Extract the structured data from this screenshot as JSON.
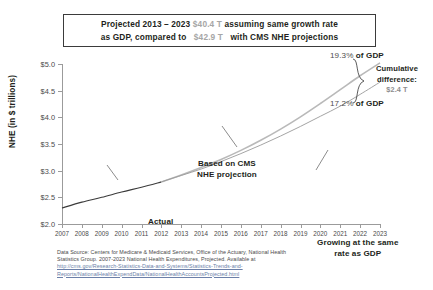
{
  "title": {
    "line1_prefix": "Projected 2013 – 2023",
    "line1_amount": "$40.4 T",
    "line1_suffix": "assuming same growth rate",
    "line2_prefix": "as GDP, compared to",
    "line2_amount": "$42.9 T",
    "line2_suffix": "with CMS NHE projections"
  },
  "annotations": {
    "actual": "Actual",
    "cms_line1": "Based on CMS",
    "cms_line2": "NHE projection",
    "gdp_line1": "Growing at the same",
    "gdp_line2": "rate as GDP"
  },
  "callouts": {
    "top_pct": "19.3%",
    "top_pct_suffix": " of GDP",
    "bottom_pct": "17.2%",
    "bottom_pct_suffix": " of GDP",
    "cumulative_label1": "Cumulative",
    "cumulative_label2": "difference:",
    "cumulative_value": "$2.4 T"
  },
  "source": {
    "line1": "Data Source: Centers for Medicare & Medicaid Services, Office of the Actuary, National Health",
    "line2": "Statistics Group. 2007-2023 National Health Expenditures, Projected. Available at",
    "url1": "http://cms.gov/Research-Statistics-Data-and-Systems/Statistics-Trends-and-",
    "url2": "Reports/NationalHealthExpendData/NationalHealthAccountsProjected.html"
  },
  "colors": {
    "actual_line": "#3b3b3b",
    "cms_line": "#b9b9b9",
    "gdp_line": "#9a9a9a",
    "axis": "#9b9b9b",
    "amount_gray": "#a6a6a6",
    "url_blue": "#6b7fa8"
  },
  "chart_data": {
    "type": "line",
    "xlabel": "",
    "ylabel": "NHE (in $ trillions)",
    "xlim": [
      2007,
      2023
    ],
    "ylim": [
      2.0,
      5.0
    ],
    "ytick_labels": [
      "$2.0",
      "$2.5",
      "$3.0",
      "$3.5",
      "$4.0",
      "$4.5",
      "$5.0"
    ],
    "ytick_values": [
      2.0,
      2.5,
      3.0,
      3.5,
      4.0,
      4.5,
      5.0
    ],
    "x": [
      2007,
      2008,
      2009,
      2010,
      2011,
      2012,
      2013,
      2014,
      2015,
      2016,
      2017,
      2018,
      2019,
      2020,
      2021,
      2022,
      2023
    ],
    "grid": false,
    "legend": "none",
    "series": [
      {
        "name": "Actual",
        "style": "solid",
        "color": "#3b3b3b",
        "values": [
          2.3,
          2.41,
          2.5,
          2.6,
          2.69,
          2.79,
          null,
          null,
          null,
          null,
          null,
          null,
          null,
          null,
          null,
          null,
          null
        ]
      },
      {
        "name": "Based on CMS NHE projection",
        "style": "solid-light",
        "color": "#b9b9b9",
        "values": [
          null,
          null,
          null,
          null,
          null,
          2.79,
          2.92,
          3.06,
          3.21,
          3.38,
          3.57,
          3.78,
          4.01,
          4.26,
          4.52,
          4.78,
          5.02
        ]
      },
      {
        "name": "Growing at the same rate as GDP",
        "style": "solid-gray",
        "color": "#9a9a9a",
        "values": [
          null,
          null,
          null,
          null,
          null,
          2.79,
          2.91,
          3.03,
          3.17,
          3.32,
          3.48,
          3.65,
          3.83,
          4.02,
          4.21,
          4.43,
          4.66
        ]
      }
    ],
    "annotations": [
      {
        "text": "Actual",
        "x": 2010.5,
        "y": 2.62
      },
      {
        "text": "Based on CMS NHE projection",
        "x": 2014.5,
        "y": 4.35
      },
      {
        "text": "Growing at the same rate as GDP",
        "x": 2020.0,
        "y": 2.7
      },
      {
        "text": "19.3% of GDP",
        "x": 2023,
        "y": 5.02
      },
      {
        "text": "17.2% of GDP",
        "x": 2023,
        "y": 4.66
      },
      {
        "text": "Cumulative difference: $2.4 T",
        "x": 2023,
        "y": 4.84
      }
    ]
  }
}
